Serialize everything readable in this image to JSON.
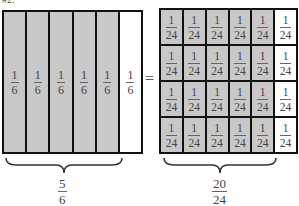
{
  "header": {
    "cropped_label": "#2."
  },
  "left_model": {
    "strips": [
      {
        "numerator": "1",
        "denominator": "6",
        "shaded": true
      },
      {
        "numerator": "1",
        "denominator": "6",
        "shaded": true
      },
      {
        "numerator": "1",
        "denominator": "6",
        "shaded": true
      },
      {
        "numerator": "1",
        "denominator": "6",
        "shaded": true
      },
      {
        "numerator": "1",
        "denominator": "6",
        "shaded": true
      },
      {
        "numerator": "1",
        "denominator": "6",
        "shaded": false
      }
    ],
    "result": {
      "numerator": "5",
      "denominator": "6"
    }
  },
  "equals_sign": "=",
  "right_model": {
    "rows": 4,
    "cols": 6,
    "cell": {
      "numerator": "1",
      "denominator": "24"
    },
    "shaded_cols": 5,
    "result": {
      "numerator": "20",
      "denominator": "24"
    }
  },
  "colors": {
    "shaded": "#c8c8c8",
    "unshaded": "#ffffff",
    "border": "#111111"
  }
}
